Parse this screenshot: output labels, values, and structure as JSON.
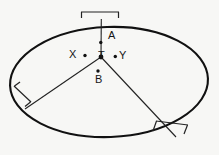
{
  "figure": {
    "background_color": "#f7f7f5",
    "ink_color": "#111111",
    "labels": [
      {
        "text": "A",
        "x": 110,
        "y": 35
      },
      {
        "text": "T",
        "x": 103,
        "y": 47
      },
      {
        "text": "Y",
        "x": 122,
        "y": 47
      },
      {
        "text": "X",
        "x": 72,
        "y": 46
      },
      {
        "text": "B",
        "x": 97,
        "y": 70
      }
    ],
    "points": [
      {
        "name": "A",
        "x": 100.5,
        "y": 42.5
      },
      {
        "name": "T",
        "x": 101.0,
        "y": 57.0
      },
      {
        "name": "Y",
        "x": 115.5,
        "y": 56.5
      },
      {
        "name": "X",
        "x": 85.0,
        "y": 55.5
      },
      {
        "name": "B",
        "x": 98.0,
        "y": 72.0
      }
    ],
    "ellipse": {
      "cx": 109,
      "cy": 82,
      "rx": 99,
      "ry": 55,
      "rotation_deg": -2,
      "stroke_width": 2.0
    },
    "chords": [
      {
        "name": "chord-up",
        "x1": 101,
        "y1": 57,
        "x2": 101,
        "y2": 20
      },
      {
        "name": "chord-lower-left",
        "x1": 101,
        "y1": 57,
        "x2": 28,
        "y2": 106
      },
      {
        "name": "chord-lower-right",
        "x1": 101,
        "y1": 57,
        "x2": 173,
        "y2": 133
      }
    ],
    "tick_marks": [
      {
        "name": "tick-top-bracket",
        "label": "top measurement bracket"
      },
      {
        "name": "tick-left-bracket",
        "label": "left measurement bracket"
      },
      {
        "name": "tick-right-bracket",
        "label": "right measurement bracket"
      }
    ]
  }
}
